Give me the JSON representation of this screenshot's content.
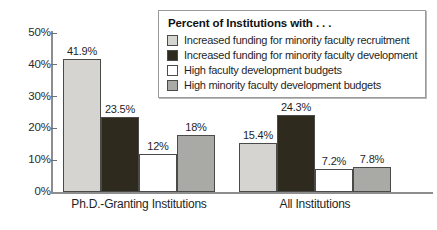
{
  "chart_data": {
    "type": "bar",
    "title": "",
    "xlabel": "",
    "ylabel": "",
    "ylim": [
      0,
      50
    ],
    "grid": false,
    "legend_position": "top-right",
    "legend_title": "Percent of Institutions with . . .",
    "categories": [
      "Ph.D.-Granting Institutions",
      "All Institutions"
    ],
    "ytick_labels": [
      "0%",
      "10%",
      "20%",
      "30%",
      "40%",
      "50%"
    ],
    "ytick_values": [
      0,
      10,
      20,
      30,
      40,
      50
    ],
    "series": [
      {
        "name": "Increased funding for minority faculty recruitment",
        "color": "#d5d4d0",
        "values": [
          41.9,
          15.4
        ],
        "labels": [
          "41.9%",
          "15.4%"
        ]
      },
      {
        "name": "Increased funding for minority faculty development",
        "color": "#2e2a1e",
        "values": [
          23.5,
          24.3
        ],
        "labels": [
          "23.5%",
          "24.3%"
        ]
      },
      {
        "name": "High faculty development budgets",
        "color": "#ffffff",
        "values": [
          12,
          7.2
        ],
        "labels": [
          "12%",
          "7.2%"
        ]
      },
      {
        "name": "High minority faculty development budgets",
        "color": "#a9a9a5",
        "values": [
          18,
          7.8
        ],
        "labels": [
          "18%",
          "7.8%"
        ]
      }
    ]
  }
}
